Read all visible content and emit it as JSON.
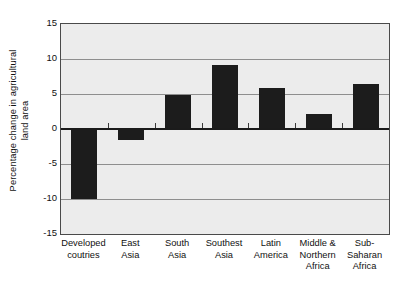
{
  "chart_data": {
    "type": "bar",
    "title": "",
    "xlabel": "",
    "ylabel": "Percentage change in agricultural land area",
    "ylabel_lines": [
      "Percentage change in agricultural",
      "land area"
    ],
    "ylim": [
      -15,
      15
    ],
    "yticks": [
      15,
      10,
      5,
      0,
      -5,
      -10,
      -15
    ],
    "ytick_labels": [
      "15",
      "10",
      "5",
      "0",
      "-5",
      "-10",
      "-15"
    ],
    "grid": true,
    "grid_axis": "y",
    "legend": "none",
    "zero_line": true,
    "categories": [
      "Developed coutries",
      "East Asia",
      "South Asia",
      "Southest Asia",
      "Latin America",
      "Middle & Northern Africa",
      "Sub-Saharan Africa"
    ],
    "category_label_lines": [
      [
        "Developed",
        "coutries"
      ],
      [
        "East",
        "Asia"
      ],
      [
        "South",
        "Asia"
      ],
      [
        "Southest",
        "Asia"
      ],
      [
        "Latin",
        "America"
      ],
      [
        "Middle &",
        "Northern",
        "Africa"
      ],
      [
        "Sub-",
        "Saharan",
        "Africa"
      ]
    ],
    "values": [
      -10.0,
      -1.5,
      4.8,
      9.2,
      5.8,
      2.2,
      6.5
    ],
    "bar_color": "#1c1c1c",
    "plot_background": "#ececec",
    "gridline_color": "#8e8e8e",
    "axis_color": "#1b1b1b",
    "figure_background": "#ffffff"
  }
}
